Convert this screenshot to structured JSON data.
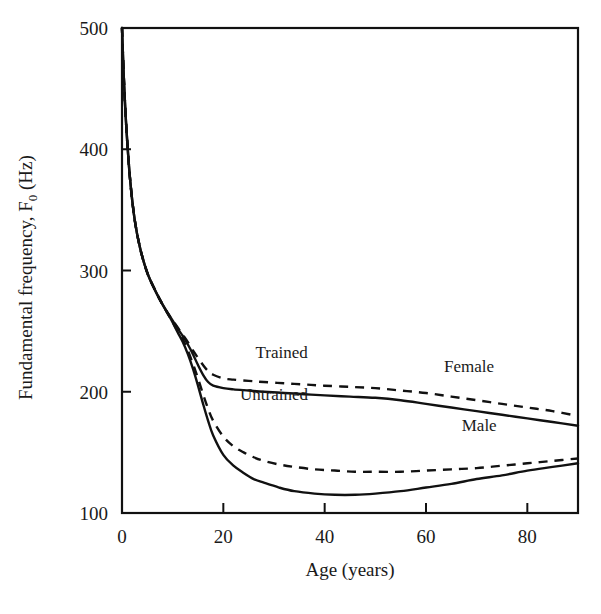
{
  "chart_data": {
    "type": "line",
    "title": "",
    "xlabel": "Age (years)",
    "ylabel": "Fundamental frequency, F",
    "ylabel_sub": "0",
    "ylabel_unit": " (Hz)",
    "xlim": [
      0,
      90
    ],
    "ylim": [
      100,
      500
    ],
    "xticks": [
      0,
      20,
      40,
      60,
      80
    ],
    "xtick_labels": [
      "0",
      "20",
      "40",
      "60",
      "80"
    ],
    "yticks": [
      100,
      200,
      300,
      400,
      500
    ],
    "ytick_labels": [
      "100",
      "200",
      "300",
      "400",
      "500"
    ],
    "grid": false,
    "legend": "inline-annotations",
    "annotations": [
      {
        "text": "Trained",
        "x": 31.5,
        "y": 228
      },
      {
        "text": "Untrained",
        "x": 30.0,
        "y": 193
      },
      {
        "text": "Female",
        "x": 68.5,
        "y": 216
      },
      {
        "text": "Male",
        "x": 70.5,
        "y": 168
      }
    ],
    "series": [
      {
        "name": "Female Trained",
        "style": "dashed",
        "x": [
          0,
          0.4,
          0.9,
          1.6,
          2.5,
          3.6,
          5,
          6.5,
          8,
          9.5,
          11,
          12,
          13,
          14,
          15,
          16,
          17,
          18,
          20,
          22,
          25,
          28,
          32,
          36,
          40,
          45,
          50,
          55,
          60,
          65,
          70,
          75,
          80,
          85,
          90
        ],
        "y": [
          500,
          455,
          415,
          375,
          342,
          318,
          298,
          284,
          272,
          262,
          253,
          247,
          241,
          234,
          228,
          222,
          217,
          214,
          211,
          210,
          209,
          208,
          207,
          206,
          205,
          204,
          203,
          201,
          199,
          196,
          193,
          190,
          187,
          184,
          180
        ]
      },
      {
        "name": "Female Untrained",
        "style": "solid",
        "x": [
          0,
          0.4,
          0.9,
          1.6,
          2.5,
          3.6,
          5,
          6.5,
          8,
          9.5,
          11,
          12,
          13,
          14,
          15,
          16,
          17,
          18,
          20,
          22,
          25,
          28,
          32,
          36,
          40,
          45,
          50,
          55,
          60,
          65,
          70,
          75,
          80,
          85,
          90
        ],
        "y": [
          500,
          455,
          415,
          375,
          342,
          318,
          298,
          284,
          272,
          262,
          252,
          246,
          239,
          231,
          222,
          214,
          208,
          205,
          203,
          202,
          201,
          200,
          199,
          198,
          197,
          196,
          195,
          193,
          190,
          187,
          184,
          181,
          178,
          175,
          172
        ]
      },
      {
        "name": "Male Trained",
        "style": "dashed",
        "x": [
          0,
          0.4,
          0.9,
          1.6,
          2.5,
          3.6,
          5,
          6.5,
          8,
          9.5,
          11,
          12,
          13,
          14,
          15,
          16,
          17,
          18,
          20,
          22,
          24,
          26,
          28,
          31,
          34,
          38,
          42,
          46,
          50,
          55,
          60,
          65,
          70,
          75,
          80,
          85,
          90
        ],
        "y": [
          500,
          455,
          415,
          375,
          342,
          318,
          298,
          284,
          272,
          261,
          250,
          243,
          234,
          223,
          211,
          198,
          186,
          176,
          163,
          155,
          150,
          146,
          143,
          140,
          138,
          136,
          135,
          134,
          134,
          134,
          135,
          136,
          137,
          139,
          141,
          143,
          145
        ]
      },
      {
        "name": "Male Untrained",
        "style": "solid",
        "x": [
          0,
          0.4,
          0.9,
          1.6,
          2.5,
          3.6,
          5,
          6.5,
          8,
          9.5,
          11,
          12,
          13,
          14,
          15,
          16,
          17,
          18,
          20,
          22,
          24,
          26,
          28,
          31,
          34,
          38,
          42,
          46,
          50,
          55,
          60,
          65,
          70,
          75,
          80,
          85,
          90
        ],
        "y": [
          500,
          455,
          415,
          375,
          342,
          318,
          298,
          284,
          272,
          261,
          249,
          241,
          231,
          219,
          205,
          190,
          176,
          164,
          148,
          139,
          133,
          128,
          125,
          121,
          118,
          116,
          115,
          115,
          116,
          118,
          121,
          124,
          128,
          131,
          135,
          138,
          141
        ]
      }
    ]
  },
  "caption": ""
}
